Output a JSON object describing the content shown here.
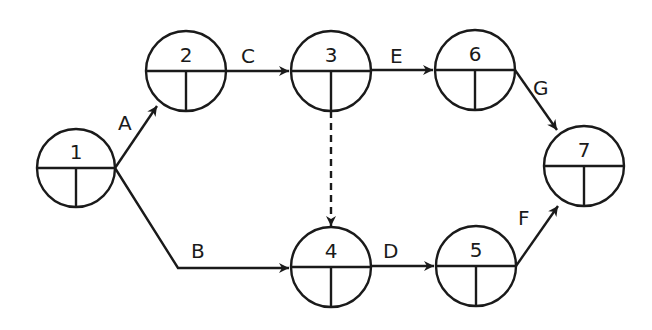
{
  "diagram": {
    "type": "activity-on-arrow network",
    "nodes": [
      {
        "id": "1",
        "label": "1",
        "cx": 76,
        "cy": 168
      },
      {
        "id": "2",
        "label": "2",
        "cx": 186,
        "cy": 71
      },
      {
        "id": "3",
        "label": "3",
        "cx": 331,
        "cy": 71
      },
      {
        "id": "6",
        "label": "6",
        "cx": 475,
        "cy": 70
      },
      {
        "id": "7",
        "label": "7",
        "cx": 584,
        "cy": 166
      },
      {
        "id": "4",
        "label": "4",
        "cx": 331,
        "cy": 267
      },
      {
        "id": "5",
        "label": "5",
        "cx": 476,
        "cy": 266
      }
    ],
    "activities": [
      {
        "label": "A",
        "from": "1",
        "to": "2",
        "dashed": false
      },
      {
        "label": "B",
        "from": "1",
        "to": "4",
        "dashed": false
      },
      {
        "label": "C",
        "from": "2",
        "to": "3",
        "dashed": false
      },
      {
        "label": "E",
        "from": "3",
        "to": "6",
        "dashed": false
      },
      {
        "label": "G",
        "from": "6",
        "to": "7",
        "dashed": false
      },
      {
        "label": "D",
        "from": "4",
        "to": "5",
        "dashed": false
      },
      {
        "label": "F",
        "from": "5",
        "to": "7",
        "dashed": false
      },
      {
        "label": "",
        "from": "3",
        "to": "4",
        "dashed": true
      }
    ]
  }
}
